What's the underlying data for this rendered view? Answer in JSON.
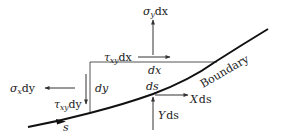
{
  "diagram": {
    "type": "boundary-element-force-balance",
    "colors": {
      "line": "#333333",
      "curve": "#111111",
      "text": "#222222",
      "background": "#ffffff"
    },
    "labels": {
      "sigma_y": {
        "symbol": "σ",
        "sub": "y",
        "rest": "dx"
      },
      "tau_xy_dx": {
        "symbol": "τ",
        "sub": "xy",
        "rest": "dx"
      },
      "dx": "dx",
      "dy": "dy",
      "sigma_x": {
        "symbol": "σ",
        "sub": "x",
        "rest": "dy"
      },
      "tau_xy_dy": {
        "symbol": "τ",
        "sub": "xy",
        "rest": "dy"
      },
      "ds": "ds",
      "X": {
        "symbol": "X",
        "rest": "ds"
      },
      "Y": {
        "symbol": "Y",
        "rest": "ds"
      },
      "boundary": "Boundary",
      "s": "s"
    }
  }
}
